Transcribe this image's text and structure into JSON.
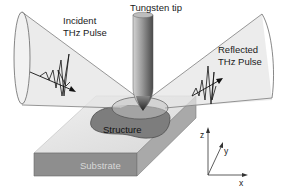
{
  "diagram": {
    "labels": {
      "tip": "Tungsten tip",
      "incident_line1": "Incident",
      "incident_line2": "THz Pulse",
      "reflected_line1": "Reflected",
      "reflected_line2": "THz Pulse",
      "structure": "Structure",
      "substrate": "Substrate"
    },
    "axes": {
      "z": "z",
      "y": "y",
      "x": "x"
    },
    "colors": {
      "substrate_top": "#e6e6e6",
      "substrate_front": "#8c8c8c",
      "substrate_side": "#a8a8a8",
      "structure": "#7a7a7a",
      "beam_fill": "#dcdcdc",
      "tip_light": "#c8c8c8",
      "tip_dark": "#5a5a5a",
      "outline": "#333333"
    }
  }
}
